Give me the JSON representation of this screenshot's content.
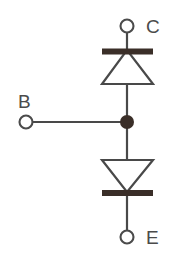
{
  "diagram": {
    "background_color": "#ffffff",
    "line_color": "#494949",
    "fill_color": "#3a2e28",
    "label_color": "#4b4b4b",
    "terminals": [
      {
        "id": "collector",
        "label": "C",
        "marker": "open-circle",
        "cx": 127,
        "cy": 26,
        "r": 6.5,
        "label_x": 146,
        "label_y": 33
      },
      {
        "id": "base",
        "label": "B",
        "marker": "open-circle",
        "cx": 26,
        "cy": 122,
        "r": 6.5,
        "label_x": 18,
        "label_y": 107
      },
      {
        "id": "emitter",
        "label": "E",
        "marker": "open-circle",
        "cx": 127,
        "cy": 237,
        "r": 6.5,
        "label_x": 146,
        "label_y": 244
      }
    ],
    "junction": {
      "id": "base-junction",
      "cx": 127,
      "cy": 122,
      "r": 7.0
    },
    "components": [
      {
        "id": "upper-diode",
        "type": "diode",
        "orientation": "cathode-up",
        "triangle_points": "102,84 153,84 127,50",
        "bar": {
          "x": 102,
          "y": 48.5,
          "width": 51,
          "height": 6
        }
      },
      {
        "id": "lower-diode",
        "type": "diode",
        "orientation": "cathode-down",
        "triangle_points": "102,160 153,160 127,192",
        "bar": {
          "x": 102,
          "y": 190,
          "width": 51,
          "height": 6
        }
      }
    ],
    "wires": [
      {
        "id": "collector-lead",
        "x1": 127,
        "y1": 32.5,
        "x2": 127,
        "y2": 52
      },
      {
        "id": "upper-diode-body-lead",
        "x1": 127,
        "y1": 52,
        "x2": 127,
        "y2": 122
      },
      {
        "id": "base-lead",
        "x1": 32.5,
        "y1": 122,
        "x2": 127,
        "y2": 122
      },
      {
        "id": "lower-diode-body-lead",
        "x1": 127,
        "y1": 122,
        "x2": 127,
        "y2": 196
      },
      {
        "id": "emitter-lead",
        "x1": 127,
        "y1": 196,
        "x2": 127,
        "y2": 230.5
      }
    ]
  }
}
